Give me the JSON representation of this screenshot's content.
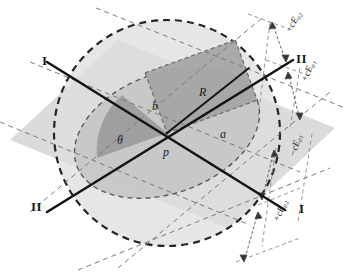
{
  "figure": {
    "background_color": "#ffffff",
    "stroke_color": "#1a1a1a",
    "colors": {
      "band_fill": "#d2d2d2",
      "ellipse_fill": "#c3c3c3",
      "rect_fill": "#a8a8a8",
      "wedge_fill": "#9e9e9e",
      "circle_fill": "#dcdcdc",
      "dash_stroke": "#2b2b2b",
      "thin_dash": "#6e6e6e"
    }
  },
  "axes": {
    "axis_one_label_start": "I",
    "axis_one_label_end": "I",
    "axis_two_label_start": "II",
    "axis_two_label_end": "II"
  },
  "annotations": {
    "radius": "R",
    "semi_minor": "b",
    "semi_major": "a",
    "angle": "θ",
    "center_point": "p"
  },
  "dimensions": [
    {
      "id": "minus-c-E02",
      "sign": "−",
      "base": "cE",
      "sub": "02",
      "text": "−cE₀₂"
    },
    {
      "id": "plus-c-E01",
      "sign": "+",
      "base": "cE",
      "sub": "01",
      "text": "+cE₀₁"
    },
    {
      "id": "minus-c-E01",
      "sign": "−",
      "base": "cE",
      "sub": "01",
      "text": "−cE₀₁"
    },
    {
      "id": "plus-c-E02",
      "sign": "+",
      "base": "cE",
      "sub": "02",
      "text": "+cE₀₂"
    }
  ]
}
